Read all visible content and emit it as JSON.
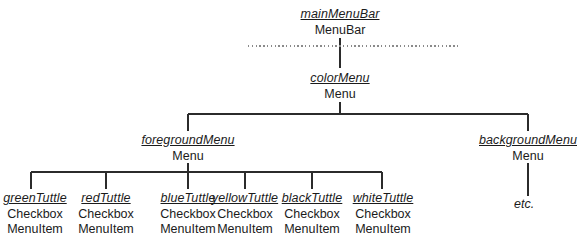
{
  "diagram": {
    "type": "uml-object-diagram",
    "line_color": "#2b2b2b",
    "text_color": "#1b1b1b",
    "dotted_line_color": "#8a8a8a",
    "etc_label": "etc."
  },
  "nodes": {
    "main_menu_bar": {
      "instance": "mainMenuBar",
      "class": "MenuBar"
    },
    "color_menu": {
      "instance": "colorMenu",
      "class": "Menu"
    },
    "foreground_menu": {
      "instance": "foregroundMenu",
      "class": "Menu"
    },
    "background_menu": {
      "instance": "backgroundMenu",
      "class": "Menu"
    },
    "leaves": [
      {
        "instance": "greenTuttle",
        "class_line1": "Checkbox",
        "class_line2": "MenuItem"
      },
      {
        "instance": "redTuttle",
        "class_line1": "Checkbox",
        "class_line2": "MenuItem"
      },
      {
        "instance": "blueTuttle",
        "class_line1": "Checkbox",
        "class_line2": "MenuItem"
      },
      {
        "instance": "yellowTuttle",
        "class_line1": "Checkbox",
        "class_line2": "MenuItem"
      },
      {
        "instance": "blackTuttle",
        "class_line1": "Checkbox",
        "class_line2": "MenuItem"
      },
      {
        "instance": "whiteTuttle",
        "class_line1": "Checkbox",
        "class_line2": "MenuItem"
      }
    ]
  }
}
